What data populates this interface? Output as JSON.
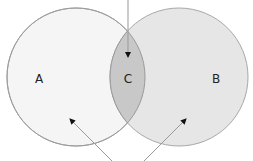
{
  "diagram": {
    "type": "venn",
    "sets": [
      {
        "id": "A",
        "label": "A",
        "cx": 76,
        "cy": 77,
        "r": 69,
        "fill": "#f5f5f5"
      },
      {
        "id": "B",
        "label": "B",
        "cx": 179,
        "cy": 77,
        "r": 69,
        "fill": "#e6e6e6"
      }
    ],
    "intersection": {
      "id": "C",
      "label": "C",
      "fill": "#c8c8c8"
    },
    "stroke_color": "#a8a8a8",
    "arrow_color": "#999999",
    "arrowhead_color": "#111111",
    "arrows": [
      {
        "name": "arrow-into-intersection",
        "x1": 128,
        "y1": 0,
        "x2": 128,
        "y2": 57
      },
      {
        "name": "arrow-into-a",
        "x1": 112,
        "y1": 161,
        "x2": 70,
        "y2": 119
      },
      {
        "name": "arrow-into-b",
        "x1": 144,
        "y1": 161,
        "x2": 186,
        "y2": 119
      }
    ],
    "labels": [
      {
        "text": "A",
        "x": 39,
        "y": 83
      },
      {
        "text": "C",
        "x": 128,
        "y": 83
      },
      {
        "text": "B",
        "x": 216,
        "y": 83
      }
    ]
  }
}
